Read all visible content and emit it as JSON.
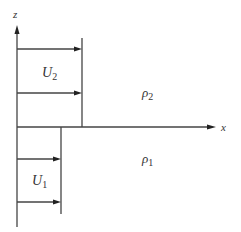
{
  "diagram": {
    "type": "velocity-profile-interface",
    "axes": {
      "vertical": {
        "label": "z"
      },
      "horizontal": {
        "label": "x"
      }
    },
    "upper_layer": {
      "velocity_label": "U",
      "velocity_subscript": "2",
      "density_label": "ρ",
      "density_subscript": "2",
      "arrow_count": 2
    },
    "lower_layer": {
      "velocity_label": "U",
      "velocity_subscript": "1",
      "density_label": "ρ",
      "density_subscript": "1",
      "arrow_count": 2
    },
    "colors": {
      "line": "#444444",
      "text": "#333333",
      "background": "#ffffff"
    }
  }
}
